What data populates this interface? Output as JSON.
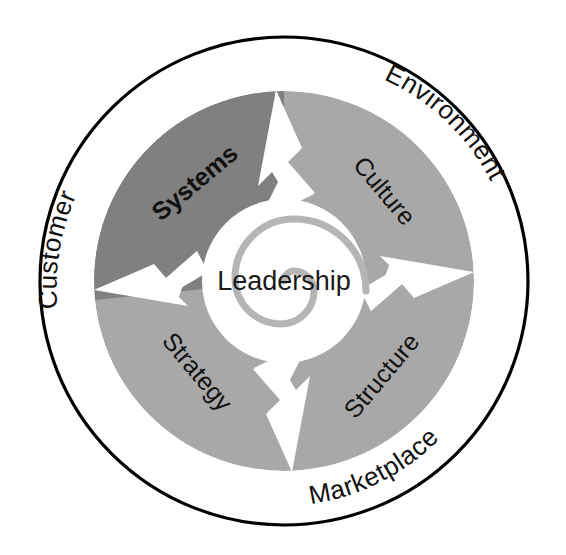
{
  "diagram": {
    "center": {
      "label": "Leadership",
      "icon": "spiral-icon"
    },
    "segments": [
      {
        "id": "systems",
        "label": "Systems",
        "emphasis": "bold",
        "color": "#808080",
        "position": "upper-left"
      },
      {
        "id": "culture",
        "label": "Culture",
        "emphasis": "normal",
        "color": "#a8a8a8",
        "position": "upper-right"
      },
      {
        "id": "structure",
        "label": "Structure",
        "emphasis": "normal",
        "color": "#a8a8a8",
        "position": "lower-right"
      },
      {
        "id": "strategy",
        "label": "Strategy",
        "emphasis": "normal",
        "color": "#a8a8a8",
        "position": "lower-left"
      }
    ],
    "ring_labels": [
      {
        "id": "customer",
        "label": "Customer",
        "position": "left"
      },
      {
        "id": "environment",
        "label": "Environment",
        "position": "upper-right"
      },
      {
        "id": "marketplace",
        "label": "Marketplace",
        "position": "bottom-right"
      }
    ],
    "colors": {
      "outer_ring_stroke": "#000000",
      "outer_ring_fill": "#ffffff",
      "segment_dark": "#808080",
      "segment_light": "#a8a8a8",
      "notch_fill": "#ffffff",
      "center_fill": "#ffffff",
      "spiral_stroke": "#b0b0b0",
      "text": "#111111",
      "background": "#ffffff"
    }
  }
}
